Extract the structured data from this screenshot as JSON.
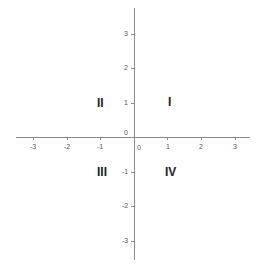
{
  "diagram": {
    "x_ticks": [
      "-3",
      "-2",
      "-1",
      "0",
      "1",
      "2",
      "3"
    ],
    "y_ticks": [
      "3",
      "2",
      "1",
      "0",
      "-1",
      "-2",
      "-3"
    ],
    "origin_label_y": "0",
    "origin_label_x": "0",
    "quadrants": {
      "q1": "I",
      "q2": "II",
      "q3": "III",
      "q4": "IV"
    },
    "axis_color": "#8a8a8a"
  }
}
